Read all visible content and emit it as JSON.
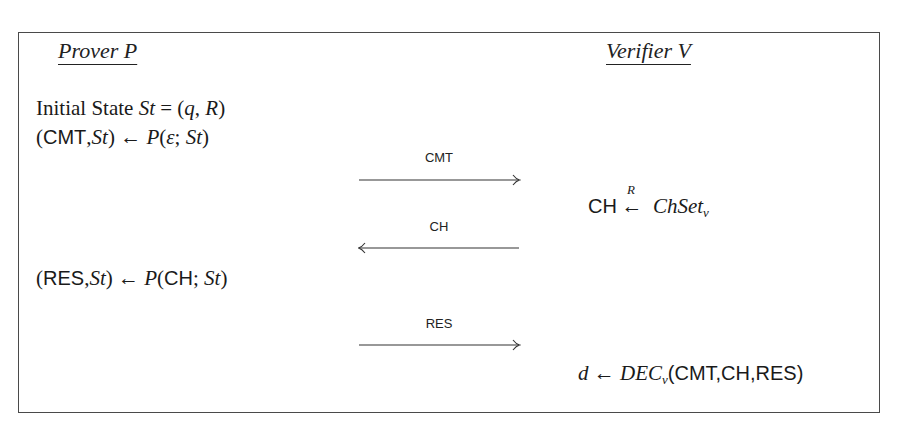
{
  "figure": {
    "type": "protocol-diagram",
    "parties": {
      "left": {
        "heading": "Prover P"
      },
      "right": {
        "heading": "Verifier V"
      }
    },
    "prover_steps": [
      {
        "id": "init",
        "prefix": "Initial State ",
        "var": "St",
        "rest": " = (",
        "q": "q",
        "comma": ", ",
        "R": "R",
        "close": ")"
      },
      {
        "id": "commit",
        "open": "(",
        "sf": "CMT",
        "comma": ",",
        "var": "St",
        "mid": ") ← ",
        "fn": "P",
        "args_open": "(",
        "eps": "ε",
        "sep": "; ",
        "st": "St",
        "args_close": ")"
      },
      {
        "id": "respond",
        "open": "(",
        "sf": "RES",
        "comma": ",",
        "var": "St",
        "mid": ") ← ",
        "fn": "P",
        "args_open": "(",
        "ch": "CH",
        "sep": "; ",
        "st": "St",
        "args_close": ")"
      }
    ],
    "messages": [
      {
        "label": "CMT",
        "direction": "right"
      },
      {
        "label": "CH",
        "direction": "left"
      },
      {
        "label": "RES",
        "direction": "right"
      }
    ],
    "verifier_steps": [
      {
        "id": "challenge",
        "sf": "CH",
        "arrow": "←",
        "arrow_sup": "R",
        "set": "ChSet",
        "set_sub": "v"
      },
      {
        "id": "decide",
        "d": "d",
        "arrow": " ← ",
        "fn": "DEC",
        "fn_sub": "v",
        "args": "(CMT,CH,RES)"
      }
    ]
  },
  "colors": {
    "border": "#4a4a4a",
    "text": "#1a1a1a",
    "background": "#ffffff"
  }
}
